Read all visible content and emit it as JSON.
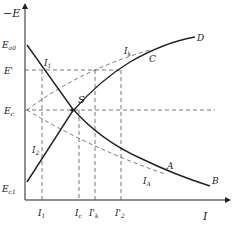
{
  "diagram": {
    "type": "polarization-curves (Evans diagram)",
    "axes": {
      "y_label": "−E",
      "x_label": "I"
    },
    "y_ticks": [
      {
        "id": "Ea0",
        "label": "E",
        "sub": "a0",
        "y": 45
      },
      {
        "id": "Eprime",
        "label": "E'",
        "sub": "",
        "y": 70
      },
      {
        "id": "Ec",
        "label": "E",
        "sub": "c",
        "y": 110
      },
      {
        "id": "Ec1",
        "label": "E",
        "sub": "c1",
        "y": 188
      }
    ],
    "x_ticks": [
      {
        "id": "I1",
        "label": "I",
        "sub": "1",
        "x": 42
      },
      {
        "id": "Ic",
        "label": "I",
        "sub": "c",
        "x": 79
      },
      {
        "id": "Iprimek",
        "label": "I'",
        "sub": "k",
        "x": 95
      },
      {
        "id": "Iprime2",
        "label": "I'",
        "sub": "2",
        "x": 121
      }
    ],
    "curve_labels": {
      "A": "A",
      "B": "B",
      "C": "C",
      "D": "D",
      "S": "S"
    },
    "point_labels": [
      {
        "id": "I1_curve",
        "label": "I",
        "sub": "1"
      },
      {
        "id": "I2_curve",
        "label": "I",
        "sub": "2"
      },
      {
        "id": "Ik_curve",
        "label": "I",
        "sub": "k"
      },
      {
        "id": "IA_curve",
        "label": "I",
        "sub": "A"
      }
    ],
    "colors": {
      "curve": "#222222",
      "dash": "#555555",
      "background": "#ffffff"
    }
  }
}
